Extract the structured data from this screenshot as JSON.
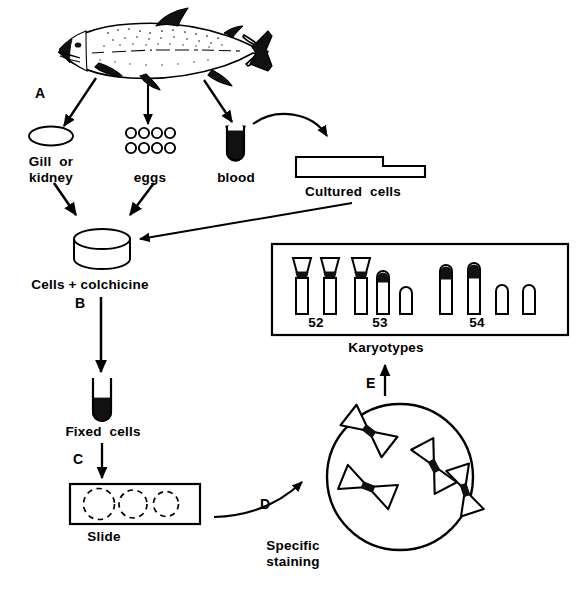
{
  "figure": {
    "background_color": "#ffffff",
    "ink_color": "#000000"
  },
  "steps": [
    {
      "id": "A",
      "label": "A",
      "meaning": "tissue sampling from fish"
    },
    {
      "id": "B",
      "label": "B",
      "meaning": "fixation of colchicine-treated cells"
    },
    {
      "id": "C",
      "label": "C",
      "meaning": "spreading fixed cells onto slide"
    },
    {
      "id": "D",
      "label": "D",
      "meaning": "specific staining of metaphase spread"
    },
    {
      "id": "E",
      "label": "E",
      "meaning": "karyotype assembly from stained metaphase"
    }
  ],
  "nodes": {
    "fish": {
      "name": "fish",
      "label": ""
    },
    "gill_kidney": {
      "name": "gill-or-kidney",
      "label": "Gill  or\nkidney",
      "line1": "Gill  or",
      "line2": "kidney"
    },
    "eggs": {
      "name": "eggs",
      "label": "eggs",
      "count": 8
    },
    "blood": {
      "name": "blood",
      "label": "blood"
    },
    "cultured_cells": {
      "name": "cultured-cells",
      "label": "Cultured  cells"
    },
    "cells_colchicine": {
      "name": "cells-plus-colchicine",
      "label": "Cells + colchicine"
    },
    "fixed_cells": {
      "name": "fixed-cells",
      "label": "Fixed  cells"
    },
    "slide": {
      "name": "slide",
      "label": "Slide",
      "spread_count": 3
    },
    "staining": {
      "name": "specific-staining",
      "label": "Specific\nstaining",
      "line1": "Specific",
      "line2": "staining"
    },
    "metaphase": {
      "name": "metaphase-cell",
      "label": "",
      "chromosome_count": 4
    },
    "karyotypes": {
      "name": "karyotypes",
      "label": "Karyotypes"
    }
  },
  "karyotype_box": {
    "name": "karyotype-box",
    "groups": [
      {
        "label": "52",
        "chromosomes": [
          {
            "type": "metacentric",
            "short_arm": true,
            "dark_centromere": true
          },
          {
            "type": "metacentric",
            "short_arm": true,
            "dark_centromere": true
          }
        ]
      },
      {
        "label": "53",
        "chromosomes": [
          {
            "type": "metacentric",
            "short_arm": true,
            "dark_centromere": true
          },
          {
            "type": "acrocentric",
            "short_arm": false,
            "dark_centromere": true
          },
          {
            "type": "telocentric",
            "short_arm": false,
            "dark_centromere": false
          }
        ]
      },
      {
        "label": "54",
        "chromosomes": [
          {
            "type": "acrocentric",
            "short_arm": false,
            "dark_centromere": true
          },
          {
            "type": "acrocentric",
            "short_arm": false,
            "dark_centromere": true
          },
          {
            "type": "telocentric",
            "short_arm": false,
            "dark_centromere": false
          },
          {
            "type": "telocentric",
            "short_arm": false,
            "dark_centromere": false
          }
        ]
      }
    ]
  },
  "arrows": [
    {
      "name": "arrow-fish-to-gill",
      "from": "fish",
      "to": "gill_kidney",
      "style": "straight"
    },
    {
      "name": "arrow-fish-to-eggs",
      "from": "fish",
      "to": "eggs",
      "style": "straight"
    },
    {
      "name": "arrow-fish-to-blood",
      "from": "fish",
      "to": "blood",
      "style": "straight"
    },
    {
      "name": "arrow-blood-to-cultured-cells",
      "from": "blood",
      "to": "cultured_cells",
      "style": "curved"
    },
    {
      "name": "arrow-gill-to-dish",
      "from": "gill_kidney",
      "to": "cells_colchicine",
      "style": "straight"
    },
    {
      "name": "arrow-eggs-to-dish",
      "from": "eggs",
      "to": "cells_colchicine",
      "style": "straight"
    },
    {
      "name": "arrow-cultured-to-dish",
      "from": "cultured_cells",
      "to": "cells_colchicine",
      "style": "straight"
    },
    {
      "name": "arrow-dish-to-fixed-cells",
      "from": "cells_colchicine",
      "to": "fixed_cells",
      "style": "straight"
    },
    {
      "name": "arrow-fixed-cells-to-slide",
      "from": "fixed_cells",
      "to": "slide",
      "style": "straight"
    },
    {
      "name": "arrow-slide-to-metaphase",
      "from": "slide",
      "to": "metaphase",
      "style": "curved"
    },
    {
      "name": "arrow-metaphase-to-karyotypes",
      "from": "metaphase",
      "to": "karyotypes",
      "style": "straight"
    }
  ]
}
